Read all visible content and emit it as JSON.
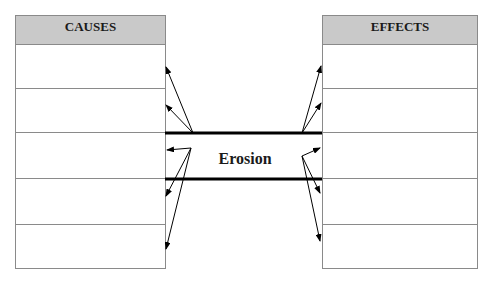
{
  "diagram": {
    "center_topic": "Erosion",
    "causes": {
      "header": "CAUSES",
      "rows": [
        "",
        "",
        "",
        "",
        ""
      ]
    },
    "effects": {
      "header": "EFFECTS",
      "rows": [
        "",
        "",
        "",
        "",
        ""
      ]
    },
    "colors": {
      "header_fill": "#c9c9c9",
      "border": "#8a8a8a",
      "line": "#000000"
    }
  }
}
